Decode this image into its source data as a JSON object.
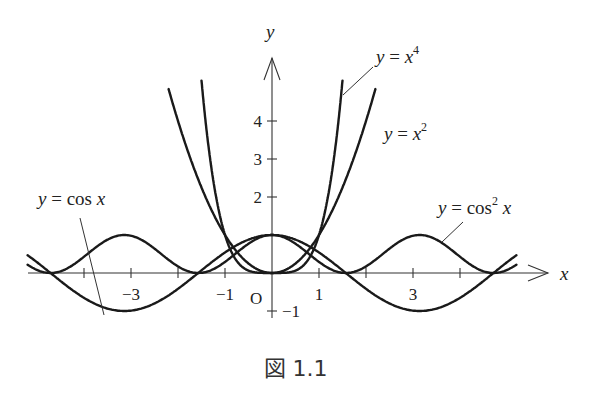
{
  "chart_data": {
    "type": "line",
    "title": "",
    "caption": "図 1.1",
    "xlabel": "x",
    "ylabel": "y",
    "xlim": [
      -5.2,
      5.2
    ],
    "ylim": [
      -1.4,
      5.0
    ],
    "origin_label": "O",
    "grid": false,
    "x_ticks": [
      {
        "value": -4,
        "label": ""
      },
      {
        "value": -3,
        "label": "−3"
      },
      {
        "value": -2,
        "label": ""
      },
      {
        "value": -1,
        "label": "−1"
      },
      {
        "value": 1,
        "label": "1"
      },
      {
        "value": 2,
        "label": ""
      },
      {
        "value": 3,
        "label": "3"
      },
      {
        "value": 4,
        "label": ""
      }
    ],
    "y_ticks": [
      {
        "value": -1,
        "label": "−1"
      },
      {
        "value": 1,
        "label": ""
      },
      {
        "value": 2,
        "label": "2"
      },
      {
        "value": 3,
        "label": "3"
      },
      {
        "value": 4,
        "label": "4"
      }
    ],
    "series": [
      {
        "name": "y = cos x",
        "function": "cos(x)",
        "domain": [
          -5.2,
          5.2
        ]
      },
      {
        "name": "y = cos² x",
        "function": "cos(x)^2",
        "domain": [
          -5.2,
          5.2
        ]
      },
      {
        "name": "y = x²",
        "function": "x^2",
        "domain": [
          -2.2,
          2.2
        ]
      },
      {
        "name": "y = x⁴",
        "function": "x^4",
        "domain": [
          -1.5,
          1.5
        ]
      }
    ],
    "annotations": [
      {
        "text_parts": [
          "y",
          " = cos ",
          "x"
        ],
        "series": "y = cos x",
        "position": "left"
      },
      {
        "text_parts": [
          "y",
          " = cos",
          "2",
          " x"
        ],
        "series": "y = cos² x",
        "position": "right"
      },
      {
        "text_parts": [
          "y",
          " = ",
          "x",
          "2"
        ],
        "series": "y = x²",
        "position": "top-right"
      },
      {
        "text_parts": [
          "y",
          " = ",
          "x",
          "4"
        ],
        "series": "y = x⁴",
        "position": "top"
      }
    ]
  }
}
